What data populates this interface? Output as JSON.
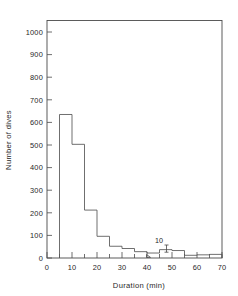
{
  "chart_data": {
    "type": "bar",
    "title": "",
    "subtitle": "",
    "xlabel": "Duration (min)",
    "ylabel": "Number of dives",
    "xlim": [
      0,
      70
    ],
    "ylim": [
      0,
      1050
    ],
    "grid": false,
    "legend": null,
    "bin_width": 5,
    "x_ticks": [
      0,
      10,
      20,
      30,
      40,
      50,
      60,
      70
    ],
    "x_tick_labels": [
      "0",
      "10",
      "20",
      "30",
      "40",
      "50",
      "60",
      "70"
    ],
    "x_minor_ticks": [
      5,
      15,
      25,
      35,
      45,
      55,
      65
    ],
    "y_ticks": [
      0,
      100,
      200,
      300,
      400,
      500,
      600,
      700,
      800,
      900,
      1000
    ],
    "y_tick_labels": [
      "0",
      "100",
      "200",
      "300",
      "400",
      "500",
      "600",
      "700",
      "800",
      "900",
      "1000"
    ],
    "bin_edges": [
      5,
      10,
      15,
      20,
      25,
      30,
      35,
      40,
      45,
      50,
      55,
      60,
      65,
      70
    ],
    "categories": [
      "5-10",
      "10-15",
      "15-20",
      "20-25",
      "25-30",
      "30-35",
      "35-40",
      "40-45",
      "45-50",
      "50-55",
      "55-60",
      "60-65",
      "65-70"
    ],
    "values": [
      635,
      503,
      212,
      96,
      52,
      42,
      28,
      22,
      37,
      33,
      12,
      14,
      16
    ],
    "annotations": [
      {
        "text": "10",
        "x": 45.5,
        "y": 95,
        "kind": "scale-reference-tick"
      }
    ]
  },
  "axes": {
    "y_title": "Number of dives",
    "x_title": "Duration (min)"
  }
}
